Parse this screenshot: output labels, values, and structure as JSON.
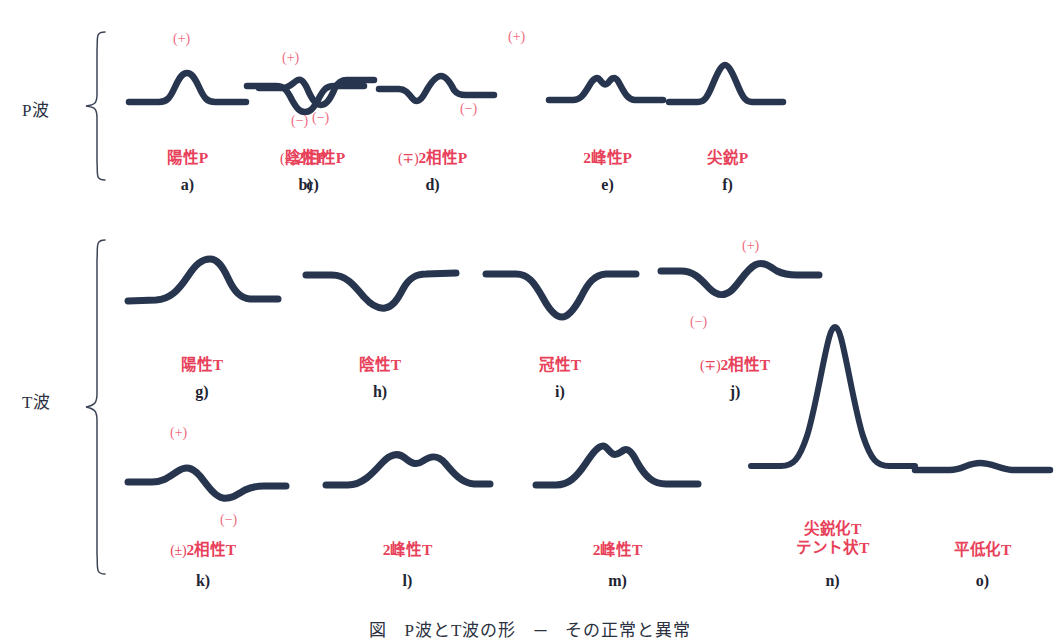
{
  "figure": {
    "caption": "図　P波とT波の形　─　その正常と異常",
    "colors": {
      "waveform": "#27354f",
      "caption_red": "#e8415a",
      "polarity_red": "#ef6c82",
      "ink_dark": "#2b3140",
      "background": "#ffffff"
    }
  },
  "groups": [
    {
      "id": "p-wave",
      "label": "P波"
    },
    {
      "id": "t-wave",
      "label": "T波"
    }
  ],
  "items": [
    {
      "letter": "a)",
      "caption": "陽性P",
      "prefix": "",
      "group": "P波",
      "polarities": [
        {
          "sign": "(+)",
          "position": "above"
        }
      ],
      "shape": "positive-hump"
    },
    {
      "letter": "b)",
      "caption": "陰性P",
      "prefix": "",
      "group": "P波",
      "polarities": [
        {
          "sign": "(−)",
          "position": "below"
        }
      ],
      "shape": "negative-dip"
    },
    {
      "letter": "c)",
      "caption": "2相性P",
      "prefix": "(±)",
      "group": "P波",
      "polarities": [
        {
          "sign": "(+)",
          "position": "above"
        },
        {
          "sign": "(−)",
          "position": "below"
        }
      ],
      "shape": "biphasic-plus-minus"
    },
    {
      "letter": "d)",
      "caption": "2相性P",
      "prefix": "(∓)",
      "group": "P波",
      "polarities": [
        {
          "sign": "(+)",
          "position": "above"
        },
        {
          "sign": "(−)",
          "position": "below"
        }
      ],
      "shape": "biphasic-minus-plus"
    },
    {
      "letter": "e)",
      "caption": "2峰性P",
      "prefix": "",
      "group": "P波",
      "polarities": [],
      "shape": "notched-double-peak"
    },
    {
      "letter": "f)",
      "caption": "尖鋭P",
      "prefix": "",
      "group": "P波",
      "polarities": [],
      "shape": "peaked-tall"
    },
    {
      "letter": "g)",
      "caption": "陽性T",
      "prefix": "",
      "group": "T波",
      "polarities": [],
      "shape": "positive-broad-hump"
    },
    {
      "letter": "h)",
      "caption": "陰性T",
      "prefix": "",
      "group": "T波",
      "polarities": [],
      "shape": "negative-broad-dip"
    },
    {
      "letter": "i)",
      "caption": "冠性T",
      "prefix": "",
      "group": "T波",
      "polarities": [],
      "shape": "coronary-deep-symmetric"
    },
    {
      "letter": "j)",
      "caption": "2相性T",
      "prefix": "(∓)",
      "group": "T波",
      "polarities": [
        {
          "sign": "(+)",
          "position": "above"
        },
        {
          "sign": "(−)",
          "position": "below"
        }
      ],
      "shape": "biphasic-minus-plus-broad"
    },
    {
      "letter": "k)",
      "caption": "2相性T",
      "prefix": "(±)",
      "group": "T波",
      "polarities": [
        {
          "sign": "(+)",
          "position": "above"
        },
        {
          "sign": "(−)",
          "position": "below"
        }
      ],
      "shape": "biphasic-plus-minus-broad"
    },
    {
      "letter": "l)",
      "caption": "2峰性T",
      "prefix": "",
      "group": "T波",
      "polarities": [],
      "shape": "bifid-broad"
    },
    {
      "letter": "m)",
      "caption": "2峰性T",
      "prefix": "",
      "group": "T波",
      "polarities": [],
      "shape": "bifid-notched-early"
    },
    {
      "letter": "n)",
      "caption": "尖鋭化T\nテント状T",
      "caption_line1": "尖鋭化T",
      "caption_line2": "テント状T",
      "prefix": "",
      "group": "T波",
      "polarities": [],
      "shape": "tented-tall-peak"
    },
    {
      "letter": "o)",
      "caption": "平低化T",
      "prefix": "",
      "group": "T波",
      "polarities": [],
      "shape": "flattened-low"
    }
  ]
}
